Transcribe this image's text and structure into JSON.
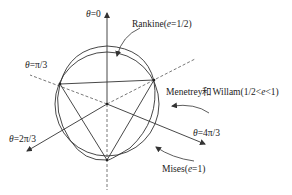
{
  "diagram": {
    "type": "deviatoric-plane yield surfaces",
    "axes": [
      {
        "id": "theta-0",
        "label_prefix": "θ",
        "label_value": "=0"
      },
      {
        "id": "theta-pi-3",
        "label_prefix": "θ",
        "label_value": "=π/3"
      },
      {
        "id": "theta-2pi-3",
        "label_prefix": "θ",
        "label_value": "=2π/3"
      },
      {
        "id": "theta-4pi-3",
        "label_prefix": "θ",
        "label_value": "=4π/3"
      }
    ],
    "curves": [
      {
        "id": "rankine",
        "name": "Rankine",
        "param_open": "(",
        "param_var": "e",
        "param_rest": "=1/2)"
      },
      {
        "id": "menetrey-willam",
        "name": "Menetrey和Willam",
        "param_open": "(1/2<",
        "param_var": "e",
        "param_rest": "<1)"
      },
      {
        "id": "mises",
        "name": "Mises",
        "param_open": "(",
        "param_var": "e",
        "param_rest": "=1)"
      }
    ],
    "colors": {
      "stroke": "#333333",
      "text": "#222222"
    }
  }
}
